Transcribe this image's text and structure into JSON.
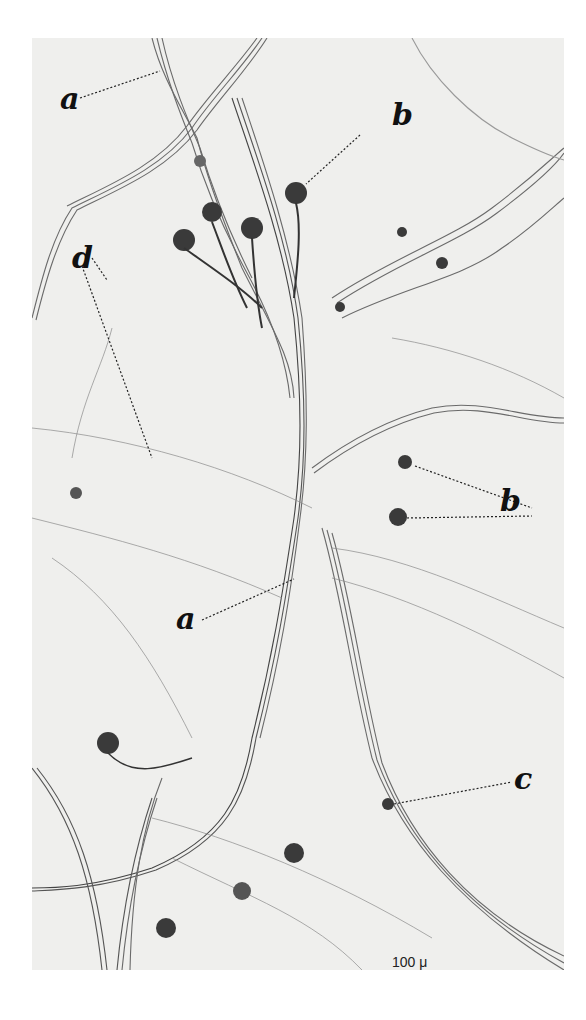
{
  "figure": {
    "type": "micrograph",
    "labels": [
      {
        "id": "a-top",
        "text": "a"
      },
      {
        "id": "b-top",
        "text": "b"
      },
      {
        "id": "d",
        "text": "d"
      },
      {
        "id": "b-right",
        "text": "b"
      },
      {
        "id": "a-middle",
        "text": "a"
      },
      {
        "id": "c",
        "text": "c"
      }
    ],
    "scale_bar": {
      "label": "100 μ"
    },
    "colors": {
      "background": "#efefed",
      "fiber": "#555555",
      "cell": "#3a3a3a",
      "leader": "#222222"
    }
  }
}
